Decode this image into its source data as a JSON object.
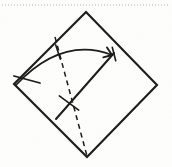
{
  "document": {
    "title": "Origami Fold Diagram",
    "kind": "scanned-line-drawing",
    "background_color": "#fdfdfc",
    "ink_color": "#1a1a1a",
    "width": 172,
    "height": 167
  },
  "page_artifacts": {
    "top_dotted_rule": {
      "name": "perforated-scan-edge",
      "color": "#b9b9b9",
      "y": 5,
      "x_start": 2,
      "x_end": 170,
      "dash": "1 2"
    }
  },
  "figure": {
    "name": "square-fold-diagram",
    "stroke_color": "#1a1a1a",
    "square": {
      "name": "paper-square",
      "stroke_width": 2.1,
      "vertices": {
        "top": [
          86,
          12
        ],
        "right": [
          157,
          85
        ],
        "bottom": [
          87,
          157
        ],
        "left": [
          14,
          84
        ]
      }
    },
    "crease_dashed": {
      "name": "dashed-crease-line",
      "stroke_width": 1.5,
      "dash": "5 4",
      "from": [
        55,
        37
      ],
      "to": [
        87,
        156
      ]
    },
    "crease_solid": {
      "name": "solid-fold-edge",
      "stroke_width": 2.0,
      "from": [
        56,
        119
      ],
      "to": [
        114,
        53
      ]
    },
    "fold_arrow": {
      "name": "fold-direction-arrow",
      "stroke_width": 1.8,
      "start": [
        16,
        85
      ],
      "control": [
        62,
        36
      ],
      "end": [
        112,
        55
      ],
      "arrowhead_size": 9
    },
    "arrow_tail_barb": {
      "name": "arrow-tail-barb",
      "stroke_width": 1.8,
      "from": [
        14,
        76
      ],
      "to": [
        40,
        83
      ]
    },
    "tick_marks": [
      {
        "name": "tick-mark-upper",
        "center": [
          58,
          52
        ],
        "angle_deg": 72,
        "length": 15,
        "stroke_width": 1.6
      },
      {
        "name": "tick-mark-lower",
        "center": [
          69,
          103
        ],
        "angle_deg": 36,
        "length": 24,
        "stroke_width": 1.6
      },
      {
        "name": "tick-mark-arrowhead",
        "center": [
          114,
          54
        ],
        "angle_deg": 76,
        "length": 14,
        "stroke_width": 1.6
      }
    ]
  }
}
